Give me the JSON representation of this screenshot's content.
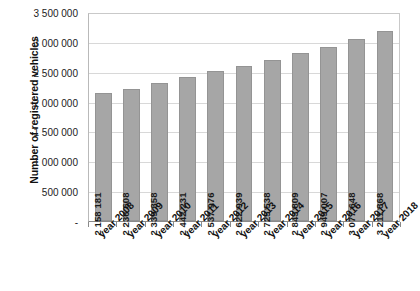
{
  "chart_data": {
    "type": "bar",
    "title": "",
    "xlabel": "",
    "ylabel": "Number of registered vehicles",
    "categories": [
      "year 2008",
      "year 2009",
      "year 2010",
      "year 2011",
      "year 2012",
      "year 2013",
      "year 2014",
      "year 2015",
      "year 2016",
      "year 2017",
      "year 2018"
    ],
    "values": [
      2158181,
      2236608,
      2339358,
      2442231,
      2537976,
      2622939,
      2725538,
      2843809,
      2949007,
      3077648,
      3211368
    ],
    "value_labels": [
      "2 158 181",
      "2 236 608",
      "2 339 358",
      "2 442 231",
      "2 537 976",
      "2 622 939",
      "2 725 538",
      "2 843 809",
      "2 949 007",
      "3 077 648",
      "3 211 368"
    ],
    "ylim": [
      0,
      3500000
    ],
    "ytick_values": [
      3500000,
      3000000,
      2500000,
      2000000,
      1500000,
      1000000,
      500000,
      0
    ],
    "ytick_labels": [
      "3 500 000",
      "3 000 000",
      "2 500 000",
      "2 000 000",
      "1 500 000",
      "1 000 000",
      "500 000",
      "-"
    ],
    "grid": true,
    "legend": false,
    "bar_color": "#a6a6a6",
    "grid_color": "#d8d8d8",
    "axis_color": "#8a8a8a"
  }
}
